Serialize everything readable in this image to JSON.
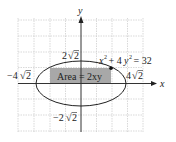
{
  "diagram": {
    "type": "ellipse-inscribed-rectangle",
    "axes": {
      "x_label": "x",
      "y_label": "y"
    },
    "equation": {
      "lhs_x": "x",
      "exp1": "2",
      "plus": " + 4",
      "lhs_y": "y",
      "exp2": "2",
      "rhs": " = 32"
    },
    "rectangle_label": "Area = 2xy",
    "intercepts": {
      "top": {
        "coef": "2",
        "rad": "2"
      },
      "bottom": {
        "coef": "−2",
        "rad": "2"
      },
      "left": {
        "coef": "−4",
        "rad": "2"
      },
      "right": {
        "coef": "4",
        "rad": "2"
      }
    },
    "colors": {
      "grid": "#cfcfcf",
      "axis": "#333333",
      "ellipse": "#222222",
      "rectangle_fill": "#a8a8a8",
      "point": "#111111"
    }
  }
}
